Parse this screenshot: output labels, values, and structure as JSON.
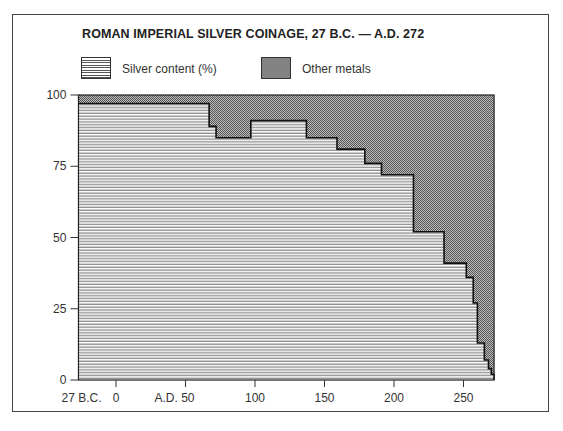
{
  "chart_data": {
    "type": "area",
    "subtype": "stacked-step-area",
    "title": "ROMAN IMPERIAL SILVER COINAGE, 27 B.C. — A.D. 272",
    "legend": [
      {
        "label": "Silver content (%)",
        "pattern": "horizontal-lines"
      },
      {
        "label": "Other metals",
        "pattern": "stipple"
      }
    ],
    "xlabel": "",
    "ylabel": "",
    "xlim": [
      -27,
      272
    ],
    "ylim": [
      0,
      100
    ],
    "x_ticks": [
      {
        "value": -27,
        "label": "27 B.C."
      },
      {
        "value": 0,
        "label": "0"
      },
      {
        "value": 50,
        "label": "A.D. 50"
      },
      {
        "value": 100,
        "label": "100"
      },
      {
        "value": 150,
        "label": "150"
      },
      {
        "value": 200,
        "label": "200"
      },
      {
        "value": 250,
        "label": "250"
      }
    ],
    "y_ticks": [
      0,
      25,
      50,
      75,
      100
    ],
    "grid": false,
    "series": [
      {
        "name": "Silver content (%)",
        "steps": [
          {
            "from": -27,
            "to": 67,
            "value": 97
          },
          {
            "from": 67,
            "to": 72,
            "value": 89
          },
          {
            "from": 72,
            "to": 97,
            "value": 85
          },
          {
            "from": 97,
            "to": 137,
            "value": 91
          },
          {
            "from": 137,
            "to": 159,
            "value": 85
          },
          {
            "from": 159,
            "to": 179,
            "value": 81
          },
          {
            "from": 179,
            "to": 191,
            "value": 76
          },
          {
            "from": 191,
            "to": 214,
            "value": 72
          },
          {
            "from": 214,
            "to": 236,
            "value": 52
          },
          {
            "from": 236,
            "to": 252,
            "value": 41
          },
          {
            "from": 252,
            "to": 257,
            "value": 36
          },
          {
            "from": 257,
            "to": 260,
            "value": 27
          },
          {
            "from": 260,
            "to": 265,
            "value": 13
          },
          {
            "from": 265,
            "to": 268,
            "value": 7
          },
          {
            "from": 268,
            "to": 270,
            "value": 4
          },
          {
            "from": 270,
            "to": 272,
            "value": 2
          }
        ]
      },
      {
        "name": "Other metals",
        "description": "remainder to 100%"
      }
    ]
  },
  "labels": {
    "title": "ROMAN IMPERIAL SILVER COINAGE,  27 B.C.  —  A.D. 272",
    "legend_silver": "Silver content (%)",
    "legend_other": "Other metals"
  }
}
